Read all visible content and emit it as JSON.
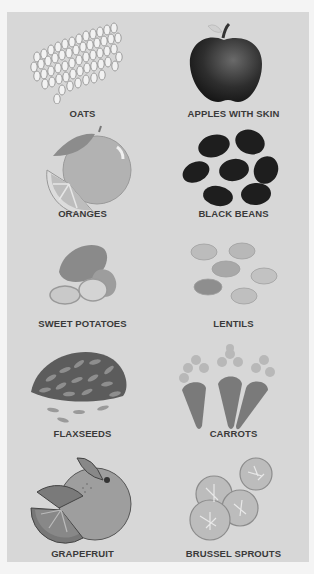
{
  "foods": [
    {
      "label": "OATS",
      "icon": "oats-icon"
    },
    {
      "label": "APPLES WITH SKIN",
      "icon": "apple-icon"
    },
    {
      "label": "ORANGES",
      "icon": "orange-icon"
    },
    {
      "label": "BLACK BEANS",
      "icon": "black-beans-icon"
    },
    {
      "label": "SWEET POTATOES",
      "icon": "sweet-potato-icon"
    },
    {
      "label": "LENTILS",
      "icon": "lentils-icon"
    },
    {
      "label": "FLAXSEEDS",
      "icon": "flaxseeds-icon"
    },
    {
      "label": "CARROTS",
      "icon": "carrot-icon"
    },
    {
      "label": "GRAPEFRUIT",
      "icon": "grapefruit-icon"
    },
    {
      "label": "BRUSSEL SPROUTS",
      "icon": "brussel-sprouts-icon"
    }
  ],
  "colors": {
    "page_background": "#f4f4f4",
    "panel_background": "#d7d7d7",
    "label_text": "#3a3a3a"
  }
}
